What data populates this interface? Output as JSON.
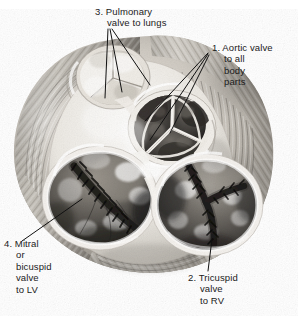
{
  "figure": {
    "view": "superior view with atria removed",
    "style": "grayscale pencil / airbrush medical illustration",
    "background_color": "#ffffff",
    "width": 298,
    "height": 316
  },
  "labels": [
    {
      "id": "pulmonary",
      "number": "3.",
      "lines": [
        "3. Pulmonary",
        "valve to lungs"
      ],
      "full_text": "3. Pulmonary valve to lungs",
      "color": "#1b1b1b",
      "leader_lines": 3
    },
    {
      "id": "aortic",
      "number": "1.",
      "lines": [
        "1. Aortic valve",
        "to all",
        "body",
        "parts"
      ],
      "full_text": "1. Aortic valve to all body parts",
      "color": "#1b1b1b",
      "leader_lines": 3
    },
    {
      "id": "tricuspid",
      "number": "2.",
      "lines": [
        "2. Tricuspid",
        "valve",
        "to RV"
      ],
      "full_text": "2. Tricuspid valve to RV",
      "color": "#1b1b1b",
      "leader_lines": 1
    },
    {
      "id": "mitral",
      "number": "4.",
      "lines": [
        "4. Mitral",
        "or",
        "bicuspid",
        "valve",
        "to LV"
      ],
      "full_text": "4. Mitral or bicuspid valve to LV",
      "color": "#1b1b1b",
      "leader_lines": 1
    }
  ],
  "anatomy": {
    "pulmonary_valve": "tri-leaflet semilunar valve, pale/white, upper left of center",
    "aortic_valve": "tri-leaflet semilunar valve, dark cusps with bright fibrous ridges, center right",
    "mitral_valve": "large oval bicuspid orifice with dark slit, lower left",
    "tricuspid_valve": "large oval orifice with Y-shaped dark commissures, lower right",
    "fibrous_skeleton": "bright white connective tissue between the valve rings",
    "myocardium": "striated muscle fibers forming the outer rim"
  },
  "palette": {
    "ink": "#1b1b1b",
    "leader_line": "#111111",
    "fibrous_white": "#f4f2ee",
    "muscle_light": "#d8d4cd",
    "muscle_mid": "#9a958d",
    "muscle_dark": "#5d5a55",
    "lumen_dark": "#3a3834",
    "lumen_darkest": "#201f1d"
  }
}
